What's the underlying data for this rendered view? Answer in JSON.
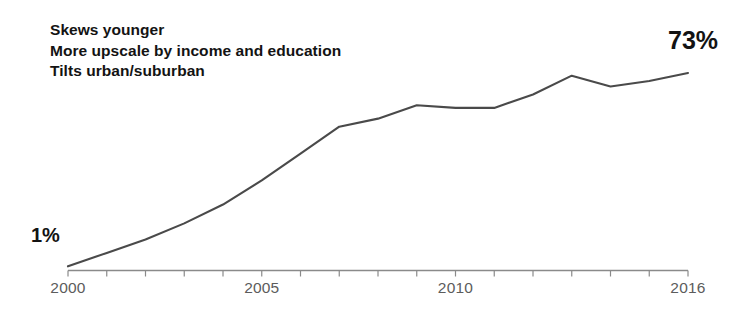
{
  "annotation": {
    "line1": "Skews younger",
    "line2": "More upscale by income and education",
    "line3": "Tilts urban/suburban"
  },
  "labels": {
    "start_value": "1%",
    "end_value": "73%"
  },
  "axis": {
    "tick_labels": [
      "2000",
      "2005",
      "2010",
      "2016"
    ]
  },
  "colors": {
    "line": "#4a4a4a",
    "axis": "#8a8a8a",
    "text_bold": "#131313",
    "text_axis": "#5c5c5c",
    "background": "#ffffff"
  },
  "chart_data": {
    "type": "line",
    "title": "",
    "xlabel": "",
    "ylabel": "",
    "x": [
      2000,
      2001,
      2002,
      2003,
      2004,
      2005,
      2006,
      2007,
      2008,
      2009,
      2010,
      2011,
      2012,
      2013,
      2014,
      2015,
      2016
    ],
    "categories": [
      "2000",
      "2001",
      "2002",
      "2003",
      "2004",
      "2005",
      "2006",
      "2007",
      "2008",
      "2009",
      "2010",
      "2011",
      "2012",
      "2013",
      "2014",
      "2015",
      "2016"
    ],
    "series": [
      {
        "name": "Adoption",
        "values": [
          1,
          6,
          11,
          17,
          24,
          33,
          43,
          53,
          56,
          61,
          60,
          60,
          65,
          72,
          68,
          70,
          73
        ]
      }
    ],
    "values": [
      1,
      6,
      11,
      17,
      24,
      33,
      43,
      53,
      56,
      61,
      60,
      60,
      65,
      72,
      68,
      70,
      73
    ],
    "xlim": [
      2000,
      2016
    ],
    "ylim": [
      0,
      80
    ],
    "grid": false,
    "legend": false,
    "tick_label_years": [
      2000,
      2005,
      2010,
      2016
    ],
    "annotations": [
      {
        "text": "1%",
        "x": 2000,
        "y": 1
      },
      {
        "text": "73%",
        "x": 2016,
        "y": 73
      },
      {
        "text": "Skews younger"
      },
      {
        "text": "More upscale by income and education"
      },
      {
        "text": "Tilts urban/suburban"
      }
    ]
  }
}
